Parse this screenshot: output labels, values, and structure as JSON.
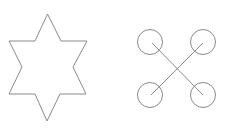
{
  "figures": [
    {
      "shape": "six-pointed-star",
      "stroke": "#8a8a8a",
      "fill": "#ffffff",
      "points": "47.5,14 61,41 87,41 73,67 86,94 60,94 47,121 35,94 9,94 22,67 9,41 35,41"
    },
    {
      "shape": "quadcopter-x",
      "stroke": "#8a8a8a",
      "circles": [
        {
          "cx": 150,
          "cy": 42,
          "r": 12.5
        },
        {
          "cx": 203,
          "cy": 42,
          "r": 12.5
        },
        {
          "cx": 150,
          "cy": 95,
          "r": 12.5
        },
        {
          "cx": 203,
          "cy": 95,
          "r": 12.5
        }
      ],
      "lines": [
        {
          "x1": 152,
          "y1": 43,
          "x2": 203,
          "y2": 95
        },
        {
          "x1": 203,
          "y1": 43,
          "x2": 151,
          "y2": 95
        }
      ]
    }
  ]
}
